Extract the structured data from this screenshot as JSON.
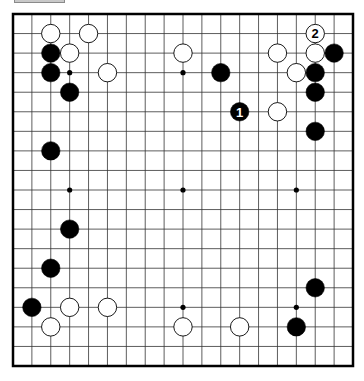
{
  "board": {
    "size": 19,
    "line_color": "#000000",
    "black_color": "#000000",
    "white_color": "#ffffff",
    "star_points": [
      [
        4,
        4
      ],
      [
        10,
        4
      ],
      [
        16,
        4
      ],
      [
        4,
        10
      ],
      [
        10,
        10
      ],
      [
        16,
        10
      ],
      [
        4,
        16
      ],
      [
        10,
        16
      ],
      [
        16,
        16
      ]
    ],
    "stones": [
      {
        "color": "white",
        "col": 3,
        "row": 2
      },
      {
        "color": "white",
        "col": 5,
        "row": 2
      },
      {
        "color": "black",
        "col": 3,
        "row": 3
      },
      {
        "color": "white",
        "col": 4,
        "row": 3
      },
      {
        "color": "black",
        "col": 3,
        "row": 4
      },
      {
        "color": "white",
        "col": 6,
        "row": 4
      },
      {
        "color": "black",
        "col": 4,
        "row": 5
      },
      {
        "color": "white",
        "col": 10,
        "row": 3
      },
      {
        "color": "black",
        "col": 12,
        "row": 4
      },
      {
        "color": "white",
        "col": 15,
        "row": 3
      },
      {
        "color": "black",
        "col": 13,
        "row": 6,
        "label": "1"
      },
      {
        "color": "white",
        "col": 15,
        "row": 6
      },
      {
        "color": "white",
        "col": 17,
        "row": 2,
        "label": "2"
      },
      {
        "color": "white",
        "col": 17,
        "row": 3
      },
      {
        "color": "black",
        "col": 18,
        "row": 3
      },
      {
        "color": "white",
        "col": 16,
        "row": 4
      },
      {
        "color": "black",
        "col": 17,
        "row": 4
      },
      {
        "color": "black",
        "col": 17,
        "row": 5
      },
      {
        "color": "black",
        "col": 17,
        "row": 7
      },
      {
        "color": "black",
        "col": 3,
        "row": 8
      },
      {
        "color": "black",
        "col": 4,
        "row": 12
      },
      {
        "color": "black",
        "col": 3,
        "row": 14
      },
      {
        "color": "black",
        "col": 2,
        "row": 16
      },
      {
        "color": "white",
        "col": 4,
        "row": 16
      },
      {
        "color": "white",
        "col": 6,
        "row": 16
      },
      {
        "color": "white",
        "col": 3,
        "row": 17
      },
      {
        "color": "black",
        "col": 17,
        "row": 15
      },
      {
        "color": "white",
        "col": 10,
        "row": 17
      },
      {
        "color": "white",
        "col": 13,
        "row": 17
      },
      {
        "color": "black",
        "col": 16,
        "row": 17
      }
    ]
  }
}
